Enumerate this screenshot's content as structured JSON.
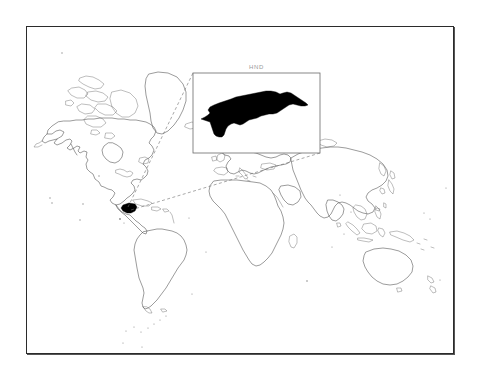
{
  "figure": {
    "background_color": "#ffffff",
    "frame_color": "#2b2b2b",
    "width": 479,
    "height": 376
  },
  "map": {
    "type": "world-locator-map",
    "projection": "equirectangular-outline",
    "coastline_color": "#4a4a4a",
    "highlight_color": "#000000",
    "highlighted_country": "Honduras",
    "highlight_region": "Central America",
    "continents_shown": [
      "North America",
      "South America",
      "Europe",
      "Africa",
      "Asia",
      "Australia",
      "Greenland",
      "New Zealand"
    ]
  },
  "inset": {
    "label": "HND",
    "label_color": "#9a9a9a",
    "border_color": "#6a6a6a",
    "shape_fill": "#000000",
    "subject": "Honduras",
    "x": 193,
    "y": 73,
    "width": 127,
    "height": 80
  },
  "leader_lines": {
    "style": "dashed",
    "color": "#6e6e6e",
    "count": 2,
    "from": "Honduras highlight on world map",
    "to": "inset box corners"
  }
}
